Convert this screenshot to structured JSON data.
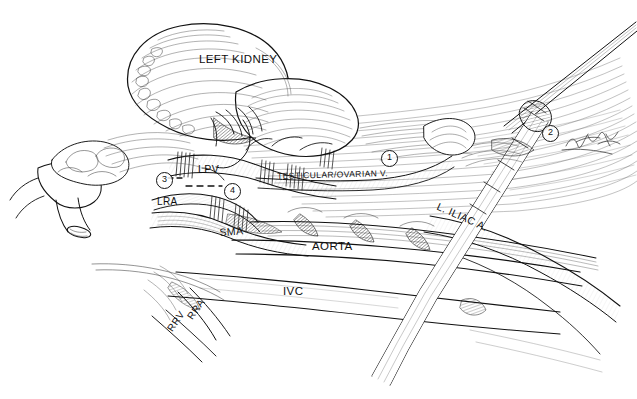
{
  "illustration": {
    "title": "Laparoscopic left renal / para-aortic vascular anatomy",
    "style": "pen-and-ink surgical line drawing",
    "background_color": "#ffffff",
    "ink_color": "#111111"
  },
  "labels": [
    {
      "id": "left-kidney",
      "text": "LEFT KIDNEY",
      "x": 199,
      "y": 53,
      "size": 11.5,
      "rotate": 0
    },
    {
      "id": "lpv",
      "text": "LPV",
      "x": 198,
      "y": 163,
      "size": 10.5,
      "rotate": 0
    },
    {
      "id": "testicular-ovarian",
      "text": "TESTICULAR/OVARIAN V.",
      "x": 277,
      "y": 171,
      "size": 8.5,
      "rotate": -1.5
    },
    {
      "id": "lra",
      "text": "LRA",
      "x": 157,
      "y": 196,
      "size": 10,
      "rotate": 0
    },
    {
      "id": "sma",
      "text": "SMA",
      "x": 219,
      "y": 226,
      "size": 10.5,
      "rotate": -4
    },
    {
      "id": "aorta",
      "text": "AORTA",
      "x": 312,
      "y": 240,
      "size": 11.5,
      "rotate": 0
    },
    {
      "id": "ivc",
      "text": "IVC",
      "x": 283,
      "y": 285,
      "size": 11.5,
      "rotate": 0
    },
    {
      "id": "rra",
      "text": "RRA",
      "x": 185,
      "y": 315,
      "size": 10,
      "rotate": -55
    },
    {
      "id": "rrv",
      "text": "RRV",
      "x": 165,
      "y": 327,
      "size": 10,
      "rotate": -55
    },
    {
      "id": "l-iliac-a",
      "text": "L. ILIAC A.",
      "x": 440,
      "y": 200,
      "size": 10.5,
      "rotate": 24
    }
  ],
  "callouts": [
    {
      "id": "callout-1",
      "text": "1",
      "x": 381,
      "y": 150
    },
    {
      "id": "callout-2",
      "text": "2",
      "x": 542,
      "y": 125
    },
    {
      "id": "callout-3",
      "text": "3",
      "x": 156,
      "y": 172
    },
    {
      "id": "callout-4",
      "text": "4",
      "x": 224,
      "y": 183
    }
  ],
  "annotations": {
    "dashed_transection_line": "dashed line between callout 3 and callout 4 across the left renal vein",
    "signature": "artist signature, lower right of callout 2"
  }
}
